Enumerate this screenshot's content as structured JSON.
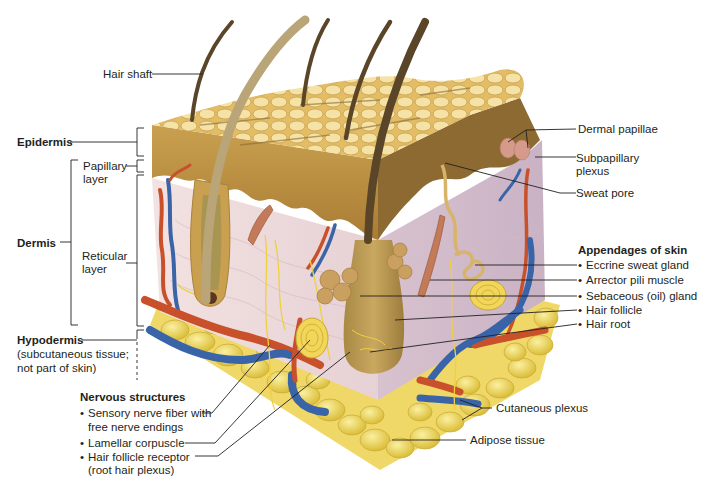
{
  "diagram": {
    "left_labels": {
      "hair_shaft": "Hair shaft",
      "epidermis": "Epidermis",
      "dermis": "Dermis",
      "papillary_line1": "Papillary",
      "papillary_line2": "layer",
      "reticular_line1": "Reticular",
      "reticular_line2": "layer",
      "hypodermis": "Hypodermis",
      "hypodermis_note1": "(subcutaneous tissue;",
      "hypodermis_note2": "not part of skin)"
    },
    "nervous": {
      "heading": "Nervous structures",
      "items": [
        {
          "line1": "Sensory nerve fiber with",
          "line2": "free nerve endings"
        },
        {
          "line1": "Lamellar corpuscle"
        },
        {
          "line1": "Hair follicle receptor",
          "line2": "(root hair plexus)"
        }
      ]
    },
    "right_labels": {
      "dermal_papillae": "Dermal papillae",
      "subpapillary_line1": "Subpapillary",
      "subpapillary_line2": "plexus",
      "sweat_pore": "Sweat pore",
      "cutaneous_plexus": "Cutaneous plexus",
      "adipose_tissue": "Adipose tissue"
    },
    "appendages": {
      "heading": "Appendages of skin",
      "items": [
        "Eccrine sweat gland",
        "Arrector pili muscle",
        "Sebaceous (oil) gland",
        "Hair follicle",
        "Hair root"
      ]
    },
    "colors": {
      "epidermis_surface": "#e7c36a",
      "epidermis_side": "#b98a3c",
      "dermis": "#ead6d8",
      "dermis_right": "#d9c3cf",
      "artery": "#c8502a",
      "vein": "#3a64a8",
      "nerve": "#f0d040",
      "adipose": "#f2dc5a",
      "hair": "#6b5330",
      "leader_line": "#231f20"
    }
  }
}
